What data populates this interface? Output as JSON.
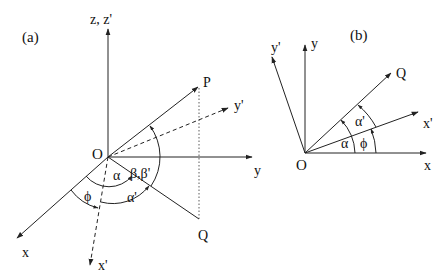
{
  "panel_a": {
    "tag": "(a)",
    "origin_label": "O",
    "axes": {
      "z": "z, z'",
      "y": "y",
      "x": "x",
      "x_prime": "x'",
      "y_prime": "y'"
    },
    "points": {
      "P": "P",
      "Q": "Q"
    },
    "angles": {
      "alpha": "α",
      "alpha_prime": "α'",
      "phi": "ϕ",
      "beta": "β,β'"
    }
  },
  "panel_b": {
    "tag": "(b)",
    "origin_label": "O",
    "axes": {
      "x": "x",
      "y": "y",
      "x_prime": "x'",
      "y_prime": "y'"
    },
    "points": {
      "Q": "Q"
    },
    "angles": {
      "alpha": "α",
      "alpha_prime": "α'",
      "phi": "ϕ"
    }
  },
  "colors": {
    "line": "#222222",
    "background": "#ffffff"
  }
}
